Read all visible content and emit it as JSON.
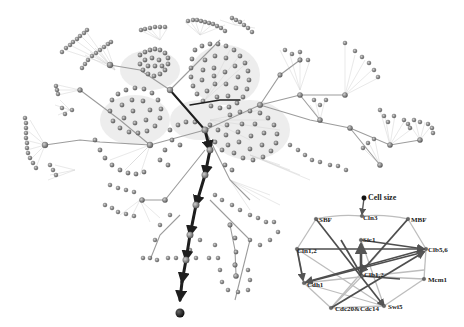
{
  "figure": {
    "colors": {
      "node": "#8a8a8a",
      "node_stroke": "#5a5a5a",
      "edge_light": "#c8c8c8",
      "edge_mid": "#9a9a9a",
      "path": "#1e1e1e",
      "endpoint": "#111111",
      "inset_edge_dark": "#555555",
      "inset_edge_light": "#bdbdbd"
    }
  },
  "inset": {
    "title_node": "Cell size",
    "nodes": [
      {
        "id": "cellsize",
        "label": "Cell size",
        "x": 364,
        "y": 198
      },
      {
        "id": "cln3",
        "label": "Cln3",
        "x": 362,
        "y": 216
      },
      {
        "id": "sbf",
        "label": "SBF",
        "x": 316,
        "y": 219
      },
      {
        "id": "mbf",
        "label": "MBF",
        "x": 408,
        "y": 219
      },
      {
        "id": "cln12",
        "label": "Cln1,2",
        "x": 297,
        "y": 249
      },
      {
        "id": "clb56",
        "label": "Clb5,6",
        "x": 426,
        "y": 249
      },
      {
        "id": "sic1",
        "label": "Sic1",
        "x": 361,
        "y": 240
      },
      {
        "id": "clb12",
        "label": "Clb1,2",
        "x": 362,
        "y": 276
      },
      {
        "id": "cdh1",
        "label": "Cdh1",
        "x": 304,
        "y": 283
      },
      {
        "id": "mcm1",
        "label": "Mcm1",
        "x": 424,
        "y": 279
      },
      {
        "id": "cdc20",
        "label": "Cdc20&Cdc14",
        "x": 331,
        "y": 308
      },
      {
        "id": "swi5",
        "label": "Swi5",
        "x": 384,
        "y": 306
      }
    ]
  }
}
